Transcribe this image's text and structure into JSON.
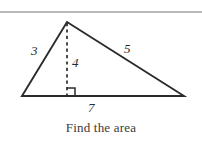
{
  "page": {
    "width": 202,
    "height": 143,
    "background": "#ffffff",
    "rule_color": "#b9b9b9",
    "stroke_color": "#2b2b2b"
  },
  "caption": {
    "text": "Find the area"
  },
  "diagram": {
    "type": "triangle-with-altitude",
    "vertices": {
      "apex": {
        "x": 67,
        "y": 22
      },
      "bottom_left": {
        "x": 22,
        "y": 96
      },
      "bottom_right": {
        "x": 184,
        "y": 96
      },
      "foot_of_altitude": {
        "x": 67,
        "y": 96
      }
    },
    "labels": {
      "left_side": "3",
      "altitude": "4",
      "right_side": "5",
      "base": "7"
    },
    "right_angle_marker": {
      "x": 67,
      "y": 88,
      "size": 8
    },
    "altitude_style": "dashed"
  }
}
